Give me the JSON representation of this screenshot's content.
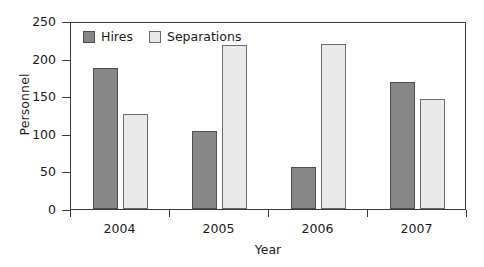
{
  "chart_data": {
    "type": "bar",
    "title": "",
    "xlabel": "Year",
    "ylabel": "Personnel",
    "categories": [
      "2004",
      "2005",
      "2006",
      "2007"
    ],
    "series": [
      {
        "name": "Hires",
        "color": "#878787",
        "values": [
          188,
          104,
          56,
          169
        ]
      },
      {
        "name": "Separations",
        "color": "#e9e9e9",
        "values": [
          126,
          218,
          220,
          146
        ]
      }
    ],
    "ylim": [
      0,
      250
    ],
    "yticks": [
      0,
      50,
      100,
      150,
      200,
      250
    ],
    "ytick_labels": [
      "0",
      "50",
      "100",
      "150",
      "200",
      "250"
    ],
    "grid": false,
    "legend_position": "top-left",
    "frame": "box"
  },
  "legend": {
    "entries": [
      {
        "label": "Hires",
        "swatch": "hires"
      },
      {
        "label": "Separations",
        "swatch": "separations"
      }
    ]
  },
  "axes": {
    "y_label": "Personnel",
    "x_label": "Year",
    "y_ticks": [
      "250",
      "200",
      "150",
      "100",
      "50",
      "0"
    ],
    "x_ticks": [
      "2004",
      "2005",
      "2006",
      "2007"
    ]
  }
}
